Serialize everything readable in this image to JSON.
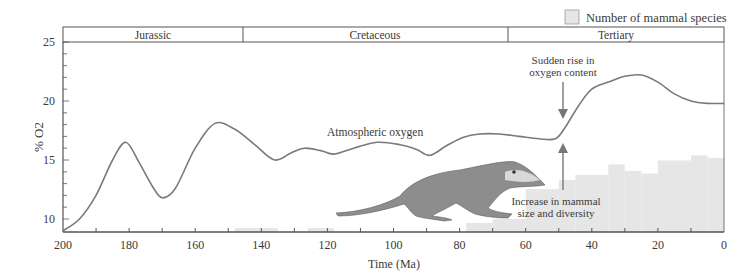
{
  "legend": {
    "label": "Number of mammal species",
    "swatch_color": "#e6e6e6"
  },
  "periods": [
    {
      "name": "Jurassic",
      "start": 200,
      "end": 145.5
    },
    {
      "name": "Cretaceous",
      "start": 145.5,
      "end": 65
    },
    {
      "name": "Tertiary",
      "start": 65,
      "end": 0
    }
  ],
  "annotations": {
    "curve_label": "Atmospheric oxygen",
    "sudden_rise_line1": "Sudden rise in",
    "sudden_rise_line2": "oxygen content",
    "increase_line1": "Increase in mammal",
    "increase_line2": "size and diversity"
  },
  "axes": {
    "xlabel": "Time (Ma)",
    "ylabel": "% O2",
    "xticks": [
      "200",
      "180",
      "160",
      "140",
      "120",
      "100",
      "80",
      "60",
      "40",
      "20",
      "0"
    ],
    "yticks": [
      "25",
      "20",
      "15",
      "10"
    ]
  },
  "chart_data": {
    "type": "line",
    "title": "",
    "xlabel": "Time (Ma)",
    "ylabel": "% O2",
    "xlim": [
      200,
      0
    ],
    "ylim": [
      9,
      25.5
    ],
    "grid": false,
    "legend_position": "top-right",
    "series": [
      {
        "name": "Atmospheric oxygen",
        "type": "line",
        "x": [
          200,
          195,
          190,
          185,
          181,
          177,
          173,
          170,
          166,
          160,
          154,
          148,
          142,
          136,
          131,
          127,
          122,
          118,
          112,
          105,
          98,
          93,
          89,
          84,
          79,
          74,
          68,
          62,
          56,
          51,
          48,
          44,
          40,
          35,
          30,
          25,
          20,
          15,
          10,
          5,
          0
        ],
        "y": [
          9.0,
          10.0,
          12.0,
          15.0,
          16.5,
          14.8,
          12.8,
          11.8,
          12.6,
          16.0,
          18.1,
          17.6,
          16.3,
          15.0,
          15.6,
          16.0,
          15.8,
          15.5,
          16.0,
          16.5,
          16.3,
          15.9,
          15.4,
          16.2,
          16.9,
          17.2,
          17.2,
          17.0,
          16.8,
          16.8,
          17.8,
          19.6,
          21.0,
          21.6,
          22.1,
          22.2,
          21.6,
          20.6,
          20.0,
          19.8,
          19.8
        ]
      },
      {
        "name": "Number of mammal species",
        "type": "bar",
        "relative": true,
        "bins": [
          {
            "from": 148,
            "to": 135,
            "height": 0.3
          },
          {
            "from": 126,
            "to": 118,
            "height": 0.3
          },
          {
            "from": 78,
            "to": 70,
            "height": 0.7
          },
          {
            "from": 70,
            "to": 60,
            "height": 1.0
          },
          {
            "from": 60,
            "to": 50,
            "height": 3.3
          },
          {
            "from": 50,
            "to": 45,
            "height": 4.0
          },
          {
            "from": 45,
            "to": 35,
            "height": 4.4
          },
          {
            "from": 35,
            "to": 30,
            "height": 5.2
          },
          {
            "from": 30,
            "to": 25,
            "height": 4.7
          },
          {
            "from": 25,
            "to": 20,
            "height": 4.5
          },
          {
            "from": 20,
            "to": 10,
            "height": 5.5
          },
          {
            "from": 10,
            "to": 5,
            "height": 5.9
          },
          {
            "from": 5,
            "to": 0,
            "height": 5.7
          }
        ]
      }
    ],
    "annotations": [
      "Atmospheric oxygen",
      "Sudden rise in oxygen content (arrow at ~50 Ma)",
      "Increase in mammal size and diversity (arrow at ~50 Ma)"
    ]
  }
}
